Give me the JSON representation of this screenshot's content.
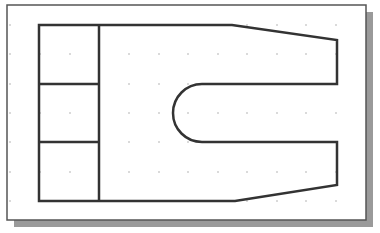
{
  "drawing": {
    "type": "cad-sketch-view",
    "frame": {
      "x": 7,
      "y": 5,
      "width": 359,
      "height": 215,
      "border": "#555555",
      "shadow": "#9a9a9a",
      "shadow_offset": 7
    },
    "grid": {
      "dot_color": "#9a9a9a",
      "xs": [
        10,
        40,
        70,
        99,
        129,
        159,
        188,
        218,
        247,
        277,
        306,
        336
      ],
      "ys": [
        25,
        54,
        84,
        113,
        142,
        172,
        201
      ]
    },
    "stroke_color": "#333333",
    "stroke_width": 2.5,
    "outline_path": "M39,25 L232,25 L337,40 L337,84 L202,84 A29,29 0 0 0 202,142 L337,142 L337,185 L235,201 L39,201 Z",
    "inner_lines": [
      {
        "x1": 99,
        "y1": 25,
        "x2": 99,
        "y2": 201
      },
      {
        "x1": 39,
        "y1": 84,
        "x2": 99,
        "y2": 84
      },
      {
        "x1": 39,
        "y1": 142,
        "x2": 99,
        "y2": 142
      }
    ]
  }
}
